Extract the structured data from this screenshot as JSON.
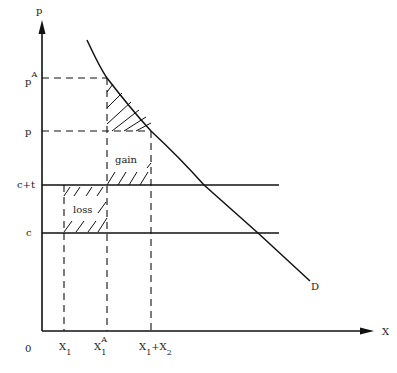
{
  "diagram": {
    "axes": {
      "y_label": "p",
      "x_label": "X",
      "origin_label": "0"
    },
    "y_ticks": [
      {
        "base": "p",
        "sup": "A",
        "id": "pA"
      },
      {
        "base": "p",
        "sup": "",
        "id": "p"
      },
      {
        "base": "c+t",
        "sup": "",
        "id": "c_plus_t"
      },
      {
        "base": "c",
        "sup": "",
        "id": "c"
      }
    ],
    "x_ticks": [
      {
        "base": "X",
        "sub": "1",
        "sup": "",
        "id": "X1"
      },
      {
        "base": "X",
        "sub": "1",
        "sup": "A",
        "id": "X1A"
      },
      {
        "base": "X",
        "sub": "1",
        "plus": "+X",
        "sub2": "2",
        "id": "X1_plus_X2"
      }
    ],
    "curve_label": "D",
    "regions": {
      "gain": "gain",
      "loss": "loss"
    }
  }
}
